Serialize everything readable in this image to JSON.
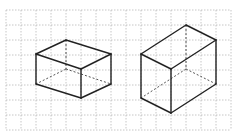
{
  "figure": {
    "grid": {
      "x0": 6,
      "y0": 10,
      "step": 15,
      "cols": 15,
      "rows": 8,
      "color": "#b8b8b8"
    },
    "edge_color": "#222222",
    "hidden_edge_color": "#555555",
    "shapes": [
      {
        "name": "left-prism",
        "visible_edges": [
          [
            66,
            40,
            111,
            54
          ],
          [
            66,
            40,
            36,
            54
          ],
          [
            36,
            54,
            81,
            69
          ],
          [
            81,
            69,
            111,
            54
          ],
          [
            36,
            54,
            36,
            84
          ],
          [
            81,
            69,
            81,
            98
          ],
          [
            111,
            54,
            111,
            84
          ],
          [
            36,
            84,
            81,
            98
          ],
          [
            81,
            98,
            111,
            84
          ]
        ],
        "hidden_edges": [
          [
            66,
            40,
            66,
            69
          ],
          [
            66,
            69,
            36,
            84
          ],
          [
            66,
            69,
            111,
            84
          ]
        ]
      },
      {
        "name": "right-prism",
        "visible_edges": [
          [
            186,
            25,
            216,
            40
          ],
          [
            186,
            25,
            141,
            54
          ],
          [
            141,
            54,
            171,
            69
          ],
          [
            171,
            69,
            216,
            40
          ],
          [
            141,
            54,
            141,
            98
          ],
          [
            171,
            69,
            171,
            113
          ],
          [
            216,
            40,
            216,
            84
          ],
          [
            141,
            98,
            171,
            113
          ],
          [
            171,
            113,
            216,
            84
          ]
        ],
        "hidden_edges": [
          [
            186,
            25,
            186,
            69
          ],
          [
            186,
            69,
            141,
            98
          ],
          [
            186,
            69,
            216,
            84
          ]
        ]
      }
    ]
  }
}
